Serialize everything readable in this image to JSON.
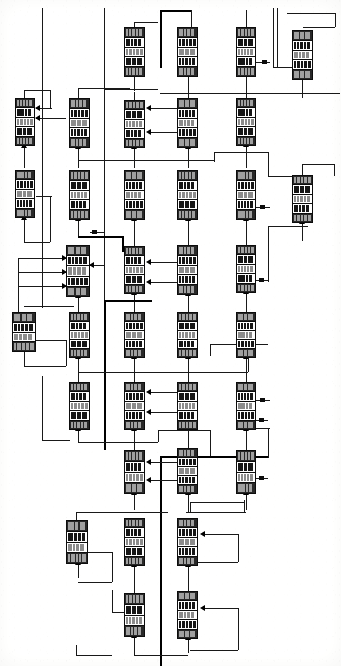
{
  "document": {
    "kind": "scanned-technical-block-diagram",
    "title": "",
    "sheet_width": 341,
    "sheet_height": 666,
    "background_color": "#fdfdfc",
    "ink_color": "#111111",
    "description": "Dense multi-column block-flow diagram of stacked multi-row modules connected by orthogonal signal wires with upward arrowheads.",
    "legible_text": "none — scan resolution too low for any block label to be read"
  },
  "legend": {
    "block_shape": "tall rectangle subdivided into 4-6 horizontal text rows",
    "wire_style": "orthogonal single-weight lines, some bold trunk lines",
    "arrow_style": "small solid triangles entering blocks from below and from the right"
  },
  "columns": [
    {
      "id": "c1",
      "x": 15
    },
    {
      "id": "c2",
      "x": 66
    },
    {
      "id": "c3",
      "x": 121
    },
    {
      "id": "c4",
      "x": 176
    },
    {
      "id": "c5",
      "x": 231
    },
    {
      "id": "c6",
      "x": 289
    }
  ],
  "blocks": [
    {
      "id": "b01",
      "col": "c3",
      "x": 124,
      "y": 27,
      "w": 21,
      "h": 50,
      "rows": [
        "dk",
        "md",
        "lt",
        "md",
        "dk"
      ]
    },
    {
      "id": "b02",
      "col": "c4",
      "x": 177,
      "y": 27,
      "w": 21,
      "h": 50,
      "rows": [
        "dk",
        "md",
        "lt",
        "md",
        "dk"
      ]
    },
    {
      "id": "b03",
      "col": "c5",
      "x": 236,
      "y": 27,
      "w": 20,
      "h": 50,
      "rows": [
        "dk",
        "md",
        "lt",
        "md",
        "dk"
      ]
    },
    {
      "id": "b04",
      "col": "c6",
      "x": 292,
      "y": 30,
      "w": 21,
      "h": 50,
      "rows": [
        "dk",
        "md",
        "lt",
        "md",
        "dk"
      ]
    },
    {
      "id": "b05",
      "col": "c1",
      "x": 15,
      "y": 98,
      "w": 20,
      "h": 48,
      "rows": [
        "dk",
        "md",
        "lt",
        "md",
        "dk"
      ]
    },
    {
      "id": "b06",
      "col": "c2",
      "x": 69,
      "y": 98,
      "w": 21,
      "h": 50,
      "rows": [
        "dk",
        "md",
        "lt",
        "md",
        "dk"
      ]
    },
    {
      "id": "b07",
      "col": "c3",
      "x": 124,
      "y": 100,
      "w": 21,
      "h": 48,
      "rows": [
        "dk",
        "md",
        "lt",
        "md",
        "dk"
      ]
    },
    {
      "id": "b08",
      "col": "c4",
      "x": 177,
      "y": 98,
      "w": 21,
      "h": 50,
      "rows": [
        "dk",
        "md",
        "lt",
        "md",
        "dk"
      ]
    },
    {
      "id": "b09",
      "col": "c5",
      "x": 236,
      "y": 98,
      "w": 20,
      "h": 48,
      "rows": [
        "dk",
        "md",
        "lt",
        "md",
        "dk"
      ]
    },
    {
      "id": "b10",
      "col": "c1",
      "x": 15,
      "y": 170,
      "w": 20,
      "h": 48,
      "rows": [
        "dk",
        "md",
        "lt",
        "md",
        "dk"
      ]
    },
    {
      "id": "b11",
      "col": "c2",
      "x": 69,
      "y": 170,
      "w": 21,
      "h": 50,
      "rows": [
        "dk",
        "md",
        "lt",
        "md",
        "dk"
      ]
    },
    {
      "id": "b12",
      "col": "c3",
      "x": 124,
      "y": 170,
      "w": 21,
      "h": 50,
      "rows": [
        "dk",
        "md",
        "lt",
        "md",
        "dk"
      ]
    },
    {
      "id": "b13",
      "col": "c4",
      "x": 177,
      "y": 170,
      "w": 21,
      "h": 50,
      "rows": [
        "dk",
        "md",
        "lt",
        "md",
        "dk"
      ]
    },
    {
      "id": "b14",
      "col": "c5",
      "x": 236,
      "y": 170,
      "w": 20,
      "h": 50,
      "rows": [
        "dk",
        "md",
        "lt",
        "md",
        "dk"
      ]
    },
    {
      "id": "b15",
      "col": "c6",
      "x": 292,
      "y": 175,
      "w": 21,
      "h": 48,
      "rows": [
        "dk",
        "md",
        "lt",
        "md",
        "dk"
      ]
    },
    {
      "id": "b16",
      "col": "c2",
      "x": 66,
      "y": 245,
      "w": 24,
      "h": 52,
      "rows": [
        "dk",
        "md",
        "lt",
        "md",
        "dk"
      ]
    },
    {
      "id": "b17",
      "col": "c3",
      "x": 124,
      "y": 246,
      "w": 21,
      "h": 48,
      "rows": [
        "dk",
        "md",
        "lt",
        "md",
        "dk"
      ]
    },
    {
      "id": "b18",
      "col": "c4",
      "x": 177,
      "y": 245,
      "w": 21,
      "h": 50,
      "rows": [
        "dk",
        "md",
        "lt",
        "md",
        "dk"
      ]
    },
    {
      "id": "b19",
      "col": "c5",
      "x": 236,
      "y": 245,
      "w": 20,
      "h": 48,
      "rows": [
        "dk",
        "md",
        "lt",
        "md",
        "dk"
      ]
    },
    {
      "id": "b20",
      "col": "c1",
      "x": 12,
      "y": 312,
      "w": 24,
      "h": 40,
      "rows": [
        "dk",
        "md",
        "lt",
        "dk"
      ]
    },
    {
      "id": "b21",
      "col": "c2",
      "x": 69,
      "y": 312,
      "w": 21,
      "h": 46,
      "rows": [
        "dk",
        "md",
        "lt",
        "md",
        "dk"
      ]
    },
    {
      "id": "b22",
      "col": "c3",
      "x": 124,
      "y": 312,
      "w": 21,
      "h": 46,
      "rows": [
        "dk",
        "md",
        "lt",
        "md",
        "dk"
      ]
    },
    {
      "id": "b23",
      "col": "c4",
      "x": 177,
      "y": 312,
      "w": 21,
      "h": 46,
      "rows": [
        "dk",
        "md",
        "lt",
        "md",
        "dk"
      ]
    },
    {
      "id": "b24",
      "col": "c5",
      "x": 236,
      "y": 312,
      "w": 20,
      "h": 46,
      "rows": [
        "dk",
        "md",
        "lt",
        "md",
        "dk"
      ]
    },
    {
      "id": "b25",
      "col": "c2",
      "x": 69,
      "y": 382,
      "w": 21,
      "h": 48,
      "rows": [
        "dk",
        "md",
        "lt",
        "md",
        "dk"
      ]
    },
    {
      "id": "b26",
      "col": "c3",
      "x": 124,
      "y": 382,
      "w": 21,
      "h": 48,
      "rows": [
        "dk",
        "md",
        "lt",
        "md",
        "dk"
      ]
    },
    {
      "id": "b27",
      "col": "c4",
      "x": 177,
      "y": 382,
      "w": 21,
      "h": 48,
      "rows": [
        "dk",
        "md",
        "lt",
        "md",
        "dk"
      ]
    },
    {
      "id": "b28",
      "col": "c5",
      "x": 236,
      "y": 382,
      "w": 20,
      "h": 48,
      "rows": [
        "dk",
        "md",
        "lt",
        "md",
        "dk"
      ]
    },
    {
      "id": "b29",
      "col": "c3",
      "x": 124,
      "y": 450,
      "w": 21,
      "h": 44,
      "rows": [
        "dk",
        "md",
        "lt",
        "dk"
      ]
    },
    {
      "id": "b30",
      "col": "c4",
      "x": 177,
      "y": 448,
      "w": 21,
      "h": 46,
      "rows": [
        "dk",
        "md",
        "lt",
        "md",
        "dk"
      ]
    },
    {
      "id": "b31",
      "col": "c5",
      "x": 236,
      "y": 450,
      "w": 20,
      "h": 44,
      "rows": [
        "dk",
        "md",
        "lt",
        "dk"
      ]
    },
    {
      "id": "b32",
      "col": "c2",
      "x": 66,
      "y": 520,
      "w": 22,
      "h": 44,
      "rows": [
        "dk",
        "md",
        "lt",
        "dk"
      ]
    },
    {
      "id": "b33",
      "col": "c3",
      "x": 124,
      "y": 518,
      "w": 21,
      "h": 48,
      "rows": [
        "dk",
        "md",
        "lt",
        "md",
        "dk"
      ]
    },
    {
      "id": "b34",
      "col": "c4",
      "x": 177,
      "y": 518,
      "w": 21,
      "h": 48,
      "rows": [
        "dk",
        "md",
        "lt",
        "md",
        "dk"
      ]
    },
    {
      "id": "b35",
      "col": "c3",
      "x": 124,
      "y": 593,
      "w": 21,
      "h": 44,
      "rows": [
        "dk",
        "md",
        "lt",
        "dk"
      ]
    },
    {
      "id": "b36",
      "col": "c4",
      "x": 177,
      "y": 591,
      "w": 21,
      "h": 48,
      "rows": [
        "dk",
        "md",
        "lt",
        "md",
        "dk"
      ]
    }
  ],
  "annotations": {
    "micro_labels": [
      "",
      "",
      "",
      "",
      "",
      "",
      "",
      "",
      "",
      "",
      "",
      "",
      "",
      "",
      "",
      "",
      "",
      ""
    ],
    "note": "small wire-side tick marks are illegible in the source scan"
  },
  "counts": {
    "blocks": 36,
    "columns": 6,
    "rows_of_blocks": 9
  }
}
